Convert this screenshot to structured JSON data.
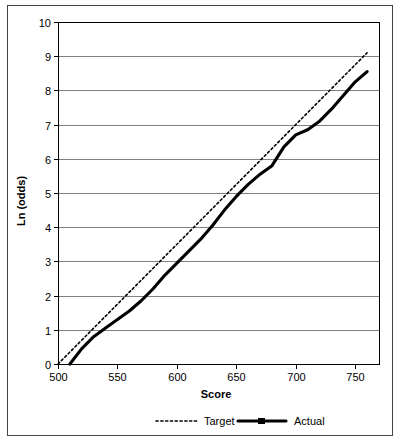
{
  "chart_data": {
    "type": "line",
    "title": "",
    "xlabel": "Score",
    "ylabel": "Ln (odds)",
    "xlim": [
      500,
      770
    ],
    "ylim": [
      0,
      10
    ],
    "xticks": [
      500,
      550,
      600,
      650,
      700,
      750
    ],
    "yticks": [
      0,
      1,
      2,
      3,
      4,
      5,
      6,
      7,
      8,
      9,
      10
    ],
    "xtick_labels": [
      "500",
      "550",
      "600",
      "650",
      "700",
      "750"
    ],
    "ytick_labels": [
      "0",
      "1",
      "2",
      "3",
      "4",
      "5",
      "6",
      "7",
      "8",
      "9",
      "10"
    ],
    "grid": "horizontal",
    "legend_position": "bottom",
    "series": [
      {
        "name": "Target",
        "style": "dotted",
        "color": "#000000",
        "x": [
          500,
          520,
          540,
          560,
          580,
          600,
          620,
          640,
          660,
          680,
          700,
          720,
          740,
          760
        ],
        "values": [
          0.0,
          0.7,
          1.4,
          2.1,
          2.8,
          3.5,
          4.2,
          4.9,
          5.6,
          6.3,
          7.0,
          7.7,
          8.4,
          9.1
        ]
      },
      {
        "name": "Actual",
        "style": "solid",
        "color": "#000000",
        "x": [
          510,
          520,
          530,
          540,
          550,
          560,
          570,
          580,
          590,
          600,
          610,
          620,
          630,
          640,
          650,
          660,
          670,
          680,
          690,
          700,
          710,
          720,
          730,
          740,
          750,
          760
        ],
        "values": [
          0.0,
          0.45,
          0.8,
          1.05,
          1.3,
          1.55,
          1.85,
          2.2,
          2.6,
          2.95,
          3.3,
          3.65,
          4.05,
          4.5,
          4.9,
          5.25,
          5.55,
          5.8,
          6.35,
          6.7,
          6.85,
          7.1,
          7.45,
          7.85,
          8.25,
          8.55
        ]
      }
    ]
  },
  "legend": {
    "items": [
      {
        "label": "Target",
        "marker": "dotted-line-swatch"
      },
      {
        "label": "Actual",
        "marker": "solid-line-marker-swatch"
      }
    ]
  }
}
